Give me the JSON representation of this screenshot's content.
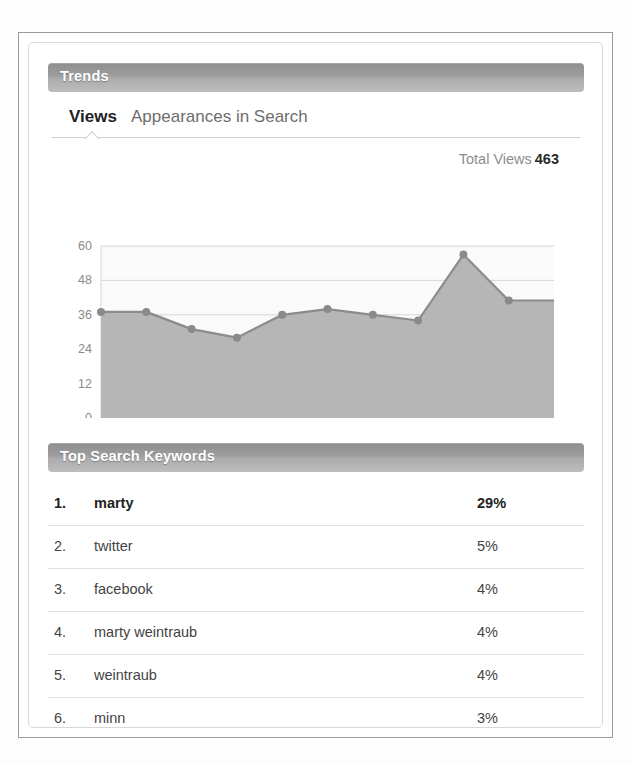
{
  "panel": {
    "trends_title": "Trends",
    "keywords_title": "Top Search Keywords"
  },
  "tabs": [
    {
      "id": "views",
      "label": "Views",
      "active": true
    },
    {
      "id": "appearances",
      "label": "Appearances in Search",
      "active": false
    }
  ],
  "summary": {
    "total_views_label": "Total Views",
    "total_views_value": "463"
  },
  "keywords": {
    "rows": [
      {
        "rank": "1.",
        "term": "marty",
        "percent": "29%"
      },
      {
        "rank": "2.",
        "term": "twitter",
        "percent": "5%"
      },
      {
        "rank": "3.",
        "term": "facebook",
        "percent": "4%"
      },
      {
        "rank": "4.",
        "term": "marty weintraub",
        "percent": "4%"
      },
      {
        "rank": "5.",
        "term": "weintraub",
        "percent": "4%"
      },
      {
        "rank": "6.",
        "term": "minn",
        "percent": "3%"
      }
    ]
  },
  "colors": {
    "header_bar_top": "#8e8e8e",
    "header_bar_bottom": "#bdbdbd",
    "area_fill": "#b6b6b6",
    "line": "#8b8b8b",
    "marker": "#8a8a8a",
    "plot_bg": "#fafafa",
    "grid": "#d6d6d6",
    "axis_text": "#8a8a8a"
  },
  "chart_data": {
    "type": "area",
    "title": "Views",
    "xlabel": "",
    "ylabel": "",
    "ylim": [
      0,
      60
    ],
    "yticks": [
      0,
      12,
      24,
      36,
      48,
      60
    ],
    "ytick_labels": [
      "0",
      "12",
      "24",
      "36",
      "48",
      "60"
    ],
    "grid": true,
    "legend": false,
    "x": [
      1,
      2,
      3,
      4,
      5,
      6,
      7,
      8,
      9,
      10,
      11
    ],
    "values": [
      37,
      37,
      31,
      28,
      36,
      38,
      36,
      34,
      57,
      41,
      41
    ],
    "series": [
      {
        "name": "Views",
        "values": [
          37,
          37,
          31,
          28,
          36,
          38,
          36,
          34,
          57,
          41,
          41
        ]
      }
    ],
    "markers": true,
    "annotations": [
      "Total Views 463"
    ]
  }
}
